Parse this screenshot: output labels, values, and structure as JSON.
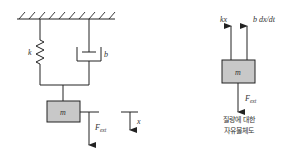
{
  "diagram": {
    "type": "mass-spring-damper",
    "colors": {
      "line": "#222222",
      "mass_fill": "#c8c8c8",
      "text": "#333333"
    },
    "system": {
      "spring_label": "k",
      "damper_label": "b",
      "mass_label": "m",
      "force_label": "F",
      "force_subscript": "ext",
      "displacement_label": "x"
    },
    "free_body": {
      "mass_label": "m",
      "spring_force_label": "kx",
      "damper_force_label": "b dx/dt",
      "force_label": "F",
      "force_subscript": "ext",
      "caption_line1": "질량에 대한",
      "caption_line2": "자유물체도"
    }
  }
}
